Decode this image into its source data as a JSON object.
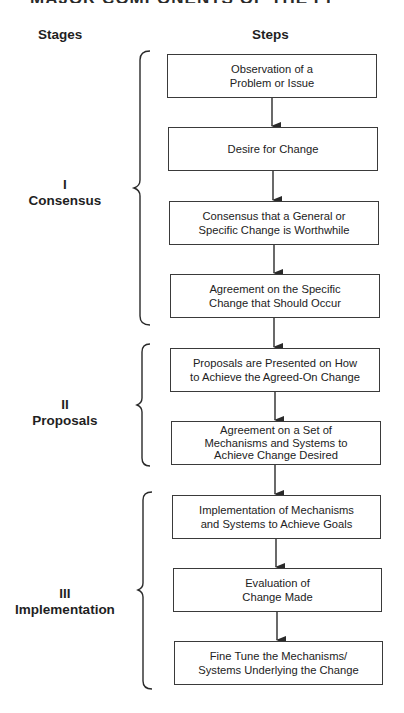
{
  "title": "MAJOR COMPONENTS OF THE PROCESS",
  "headers": {
    "stages": "Stages",
    "steps": "Steps"
  },
  "stages": [
    {
      "numeral": "I",
      "name": "Consensus"
    },
    {
      "numeral": "II",
      "name": "Proposals"
    },
    {
      "numeral": "III",
      "name": "Implementation"
    }
  ],
  "steps": [
    {
      "text": "Observation of a\nProblem or Issue",
      "stage": "I"
    },
    {
      "text": "Desire for Change",
      "stage": "I"
    },
    {
      "text": "Consensus that a General or\nSpecific Change is Worthwhile",
      "stage": "I"
    },
    {
      "text": "Agreement on the Specific\nChange that Should Occur",
      "stage": "I"
    },
    {
      "text": "Proposals are Presented on How\nto Achieve the Agreed-On Change",
      "stage": "II"
    },
    {
      "text": "Agreement on a Set of\nMechanisms and Systems to\nAchieve Change Desired",
      "stage": "II"
    },
    {
      "text": "Implementation of Mechanisms\nand Systems to Achieve Goals",
      "stage": "III"
    },
    {
      "text": "Evaluation of\nChange Made",
      "stage": "III"
    },
    {
      "text": "Fine Tune the Mechanisms/\nSystems Underlying the Change",
      "stage": "III"
    }
  ],
  "colors": {
    "line": "#3a3a3a",
    "text": "#1f1f1f",
    "background": "#ffffff"
  }
}
